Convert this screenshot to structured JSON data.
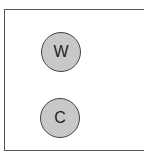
{
  "diagram": {
    "nodes": [
      {
        "label": "W",
        "fill": "#c8c8c8",
        "stroke": "#444444"
      },
      {
        "label": "C",
        "fill": "#c8c8c8",
        "stroke": "#444444"
      }
    ],
    "frame_color": "#555555"
  }
}
